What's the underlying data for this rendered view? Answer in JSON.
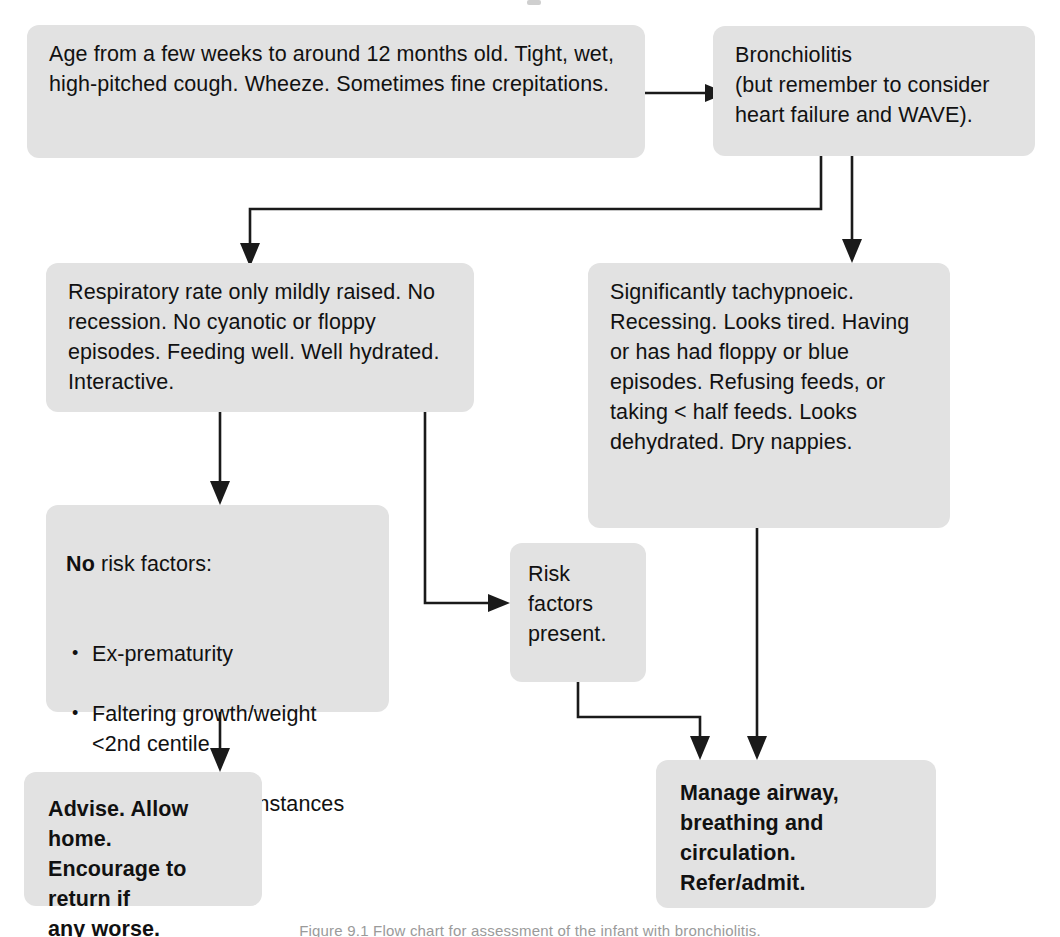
{
  "diagram": {
    "type": "flowchart",
    "caption": "Figure 9.1  Flow chart for assessment of the infant with bronchiolitis.",
    "colors": {
      "node_fill": "#e2e2e2",
      "connector": "#1a1a1a",
      "text": "#111111",
      "page_background": "#ffffff"
    },
    "nodes": {
      "presentation": {
        "label": "Age from a few weeks to around 12 months old. Tight, wet, high-pitched cough. Wheeze. Sometimes fine crepitations.",
        "bold": false
      },
      "diagnosis": {
        "label": "Bronchiolitis\n(but remember to consider heart failure and WAVE).",
        "bold": false
      },
      "mild": {
        "label": "Respiratory rate only mildly raised. No recession. No cyanotic or floppy episodes. Feeding well. Well hydrated. Interactive.",
        "bold": false
      },
      "severe": {
        "label": "Significantly tachypnoeic. Recessing. Looks tired. Having or has had floppy or blue episodes. Refusing feeds, or taking < half feeds. Looks dehydrated. Dry nappies.",
        "bold": false
      },
      "no_risk": {
        "lead": "No",
        "lead_rest": " risk factors:",
        "bullets": [
          {
            "line1": "Ex-prematurity",
            "line2": ""
          },
          {
            "line1": "Faltering growth/weight",
            "line2": "<2nd centile"
          },
          {
            "line1": "Poor social circumstances",
            "line2": ""
          }
        ]
      },
      "risk_present": {
        "label": "Risk\nfactors\npresent.",
        "bold": false
      },
      "advise": {
        "label": "Advise.  Allow home.\nEncourage to return if\nany worse.",
        "bold": true
      },
      "manage": {
        "label": "Manage airway,\nbreathing and\ncirculation.\nRefer/admit.",
        "bold": true
      }
    },
    "edges": [
      {
        "from": "presentation",
        "to": "diagnosis",
        "style": "straight-right"
      },
      {
        "from": "diagnosis",
        "to": "mild",
        "style": "down-left-down"
      },
      {
        "from": "diagnosis",
        "to": "severe",
        "style": "straight-down"
      },
      {
        "from": "mild",
        "to": "no_risk",
        "style": "straight-down"
      },
      {
        "from": "mild",
        "to": "risk_present",
        "style": "down-right"
      },
      {
        "from": "no_risk",
        "to": "advise",
        "style": "straight-down"
      },
      {
        "from": "risk_present",
        "to": "manage",
        "style": "down-right-down"
      },
      {
        "from": "severe",
        "to": "manage",
        "style": "straight-down"
      }
    ]
  }
}
